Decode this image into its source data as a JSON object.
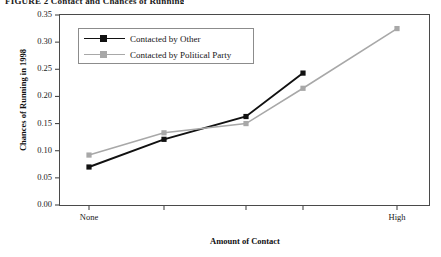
{
  "figure": {
    "title": "FIGURE 2  Contact and Chances of Running"
  },
  "chart_data": {
    "type": "line",
    "title": "",
    "xlabel": "Amount of Contact",
    "ylabel": "Chances of Running in 1998",
    "categories": [
      "None",
      "",
      "",
      "",
      "High"
    ],
    "x": [
      1,
      2,
      3,
      4,
      5
    ],
    "xtick_labels": [
      "None",
      "High"
    ],
    "ylim": [
      0.0,
      0.35
    ],
    "ytick_labels": [
      "0.00",
      "0.05",
      "0.10",
      "0.15",
      "0.20",
      "0.25",
      "0.30",
      "0.35"
    ],
    "ytick_values": [
      0.0,
      0.05,
      0.1,
      0.15,
      0.2,
      0.25,
      0.3,
      0.35
    ],
    "grid": false,
    "legend_position": "upper-left-inside",
    "series": [
      {
        "name": "Contacted by Other",
        "color": "#111111",
        "marker": "square",
        "values": [
          0.07,
          0.121,
          0.163,
          0.243,
          null
        ]
      },
      {
        "name": "Contacted by Political Party",
        "color": "#a8a8a8",
        "marker": "square",
        "values": [
          0.092,
          0.133,
          0.15,
          0.215,
          0.325
        ]
      }
    ]
  },
  "legend": {
    "items": [
      {
        "label": "Contacted by Other"
      },
      {
        "label": "Contacted by Political Party"
      }
    ]
  },
  "axes": {
    "y_ticks": [
      "0.35",
      "0.30",
      "0.25",
      "0.20",
      "0.15",
      "0.10",
      "0.05",
      "0.00"
    ],
    "x_ticks": [
      "None",
      "High"
    ]
  }
}
